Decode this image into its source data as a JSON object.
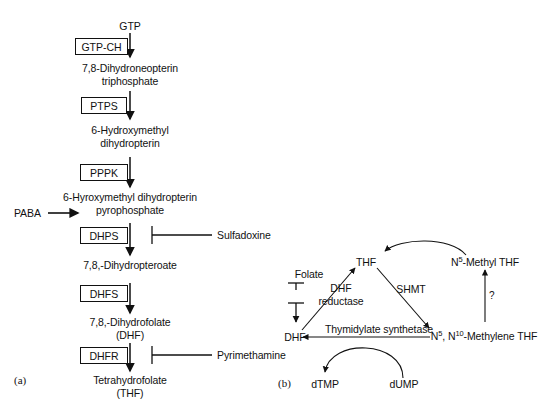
{
  "figure": {
    "width": 554,
    "height": 412,
    "background": "#ffffff",
    "stroke_color": "#111111"
  },
  "panel_a": {
    "tag": "(a)",
    "substrate_top": "GTP",
    "inputs": [
      {
        "id": "paba",
        "label": "PABA"
      }
    ],
    "metabolites": [
      {
        "id": "gtp",
        "label": "GTP",
        "lines": [
          "GTP"
        ]
      },
      {
        "id": "dhnp",
        "label": "7,8-Dihydroneopterin triphosphate",
        "lines": [
          "7,8-Dihydroneopterin",
          "triphosphate"
        ]
      },
      {
        "id": "hmdp",
        "label": "6-Hydroxymethyl dihydropterin",
        "lines": [
          "6-Hydroxymethyl",
          "dihydropterin"
        ]
      },
      {
        "id": "hmdpp",
        "label": "6-Hyroxymethyl dihydropterin pyrophosphate",
        "lines": [
          "6-Hyroxymethyl dihydropterin",
          "pyrophosphate"
        ]
      },
      {
        "id": "dhp",
        "label": "7,8,-Dihydropteroate",
        "lines": [
          "7,8,-Dihydropteroate"
        ]
      },
      {
        "id": "dhf",
        "label": "7,8,-Dihydrofolate (DHF)",
        "lines": [
          "7,8,-Dihydrofolate",
          "(DHF)"
        ]
      },
      {
        "id": "thf",
        "label": "Tetrahydrofolate (THF)",
        "lines": [
          "Tetrahydrofolate",
          "(THF)"
        ]
      }
    ],
    "enzymes": [
      {
        "id": "gtp-ch",
        "label": "GTP-CH"
      },
      {
        "id": "ptps",
        "label": "PTPS"
      },
      {
        "id": "pppk",
        "label": "PPPK"
      },
      {
        "id": "dhps",
        "label": "DHPS"
      },
      {
        "id": "dhfs",
        "label": "DHFS"
      },
      {
        "id": "dhfr",
        "label": "DHFR"
      }
    ],
    "inhibitors": [
      {
        "id": "sulfadoxine",
        "label": "Sulfadoxine",
        "target_enzyme": "DHPS"
      },
      {
        "id": "pyrimethamine",
        "label": "Pyrimethamine",
        "target_enzyme": "DHFR"
      }
    ]
  },
  "panel_b": {
    "tag": "(b)",
    "nodes": [
      {
        "id": "folate",
        "label": "Folate"
      },
      {
        "id": "dhf",
        "label": "DHF"
      },
      {
        "id": "thf",
        "label": "THF"
      },
      {
        "id": "n5_methyl_thf",
        "label": "N5-Methyl THF",
        "html": "N<span class=\"sup\">5</span>-Methyl THF"
      },
      {
        "id": "n5n10_methylene_thf",
        "label": "N5, N10-Methylene THF",
        "html": "N<span class=\"sup\">5</span>, N<span class=\"sup\">10</span>-Methylene THF"
      },
      {
        "id": "dtmp",
        "label": "dTMP"
      },
      {
        "id": "dump",
        "label": "dUMP"
      }
    ],
    "enzyme_labels": [
      {
        "id": "dhf-reductase",
        "label": "DHF reductase",
        "lines": [
          "DHF",
          "reductase"
        ]
      },
      {
        "id": "shmt",
        "label": "SHMT",
        "lines": [
          "SHMT"
        ]
      },
      {
        "id": "thymidylate-synthetase",
        "label": "Thymidylate synthetase",
        "lines": [
          "Thymidylate synthetase"
        ]
      }
    ],
    "annotations": [
      {
        "id": "unknown-step",
        "label": "?"
      }
    ]
  }
}
